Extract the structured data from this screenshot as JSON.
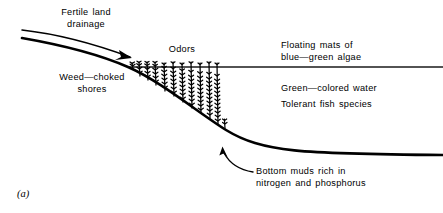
{
  "figure": {
    "panel_letter": "(a)",
    "ink_color": "#000000",
    "background_color": "#ffffff",
    "waterline_color": "#1a1a1a",
    "labels": {
      "fertile_land_drainage": "Fertile land\ndrainage",
      "weed_choked_shores": "Weed—choked\nshores",
      "odors": "Odors",
      "floating_mats": "Floating mats of\nblue—green algae",
      "green_colored_water": "Green—colored water",
      "tolerant_fish_species": "Tolerant fish species",
      "bottom_muds": "Bottom muds rich in\nnitrogen and phosphorus"
    },
    "icons": {
      "drainage_arrow": "curved-arrow-icon",
      "bottom_muds_pointer": "leader-arrow-icon",
      "aquatic_weeds": "aquatic-plant-icon",
      "waterline": "water-surface-line",
      "lake_bed": "lake-bed-profile"
    }
  }
}
